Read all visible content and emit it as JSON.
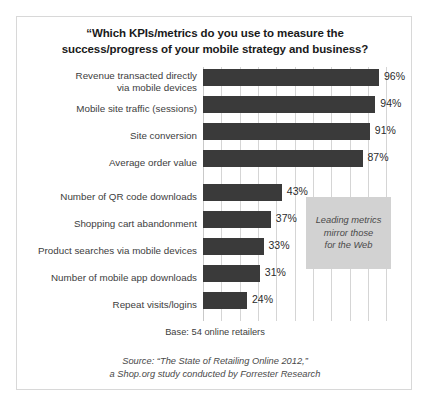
{
  "chart_data": {
    "type": "bar",
    "orientation": "horizontal",
    "title": "“Which KPIs/metrics do you use to measure the success/progress of your mobile strategy and business?",
    "title_lines": [
      "“Which KPIs/metrics do you use to measure the",
      "success/progress of your mobile strategy and business?"
    ],
    "xlabel": "",
    "ylabel": "",
    "xlim": [
      0,
      108
    ],
    "grid": true,
    "grid_axis": "x",
    "grid_step": 10,
    "legend": "none",
    "value_suffix": "%",
    "categories": [
      "Revenue transacted directly via mobile devices",
      "Mobile site traffic (sessions)",
      "Site conversion",
      "Average order value",
      "Number of QR code downloads",
      "Shopping cart abandonment",
      "Product searches via mobile devices",
      "Number of mobile app downloads",
      "Repeat visits/logins"
    ],
    "category_lines": [
      [
        "Revenue transacted directly",
        "via mobile devices"
      ],
      [
        "Mobile site traffic (sessions)"
      ],
      [
        "Site conversion"
      ],
      [
        "Average order value"
      ],
      [
        "Number of QR code downloads"
      ],
      [
        "Shopping cart abandonment"
      ],
      [
        "Product searches via mobile devices"
      ],
      [
        "Number of mobile app downloads"
      ],
      [
        "Repeat visits/logins"
      ]
    ],
    "values": [
      96,
      94,
      91,
      87,
      43,
      37,
      33,
      31,
      24
    ],
    "value_labels": [
      "96%",
      "94%",
      "91%",
      "87%",
      "43%",
      "37%",
      "33%",
      "31%",
      "24%"
    ],
    "bar_color": "#3a3a3a",
    "annotations": [
      {
        "text": "Leading metrics mirror those for the Web",
        "lines": [
          "Leading metrics",
          "mirror those",
          "for the Web"
        ],
        "style": "italic",
        "background": "#d2d2d2"
      }
    ]
  },
  "footer": {
    "base_note": "Base: 54 online retailers",
    "source_lines": [
      "Source: “The State of Retailing Online 2012,”",
      "a Shop.org study conducted by Forrester Research"
    ]
  }
}
